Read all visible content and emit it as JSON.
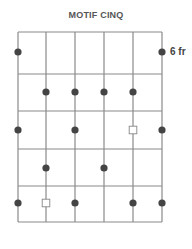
{
  "diagram": {
    "title": "MOTIF CINQ",
    "fret_label": "6 fr",
    "colors": {
      "line": "#8a8a8a",
      "dot": "#444444",
      "open_square": "#888888",
      "text": "#555555"
    },
    "strings": 6,
    "frets": 5,
    "string_x": [
      18,
      46,
      75,
      104,
      133,
      162
    ],
    "fret_y": [
      32,
      74,
      111,
      149,
      186,
      222
    ],
    "notes": [
      {
        "fret": 1,
        "string": 1,
        "type": "dot"
      },
      {
        "fret": 1,
        "string": 6,
        "type": "dot"
      },
      {
        "fret": 2,
        "string": 2,
        "type": "dot"
      },
      {
        "fret": 2,
        "string": 3,
        "type": "dot"
      },
      {
        "fret": 2,
        "string": 4,
        "type": "dot"
      },
      {
        "fret": 2,
        "string": 5,
        "type": "dot"
      },
      {
        "fret": 3,
        "string": 1,
        "type": "dot"
      },
      {
        "fret": 3,
        "string": 3,
        "type": "dot"
      },
      {
        "fret": 3,
        "string": 5,
        "type": "square"
      },
      {
        "fret": 3,
        "string": 6,
        "type": "dot"
      },
      {
        "fret": 4,
        "string": 2,
        "type": "dot"
      },
      {
        "fret": 4,
        "string": 4,
        "type": "dot"
      },
      {
        "fret": 5,
        "string": 1,
        "type": "dot"
      },
      {
        "fret": 5,
        "string": 2,
        "type": "square"
      },
      {
        "fret": 5,
        "string": 3,
        "type": "dot"
      },
      {
        "fret": 5,
        "string": 5,
        "type": "dot"
      },
      {
        "fret": 5,
        "string": 6,
        "type": "dot"
      }
    ],
    "note_y": [
      52,
      92,
      130,
      168,
      203
    ]
  }
}
